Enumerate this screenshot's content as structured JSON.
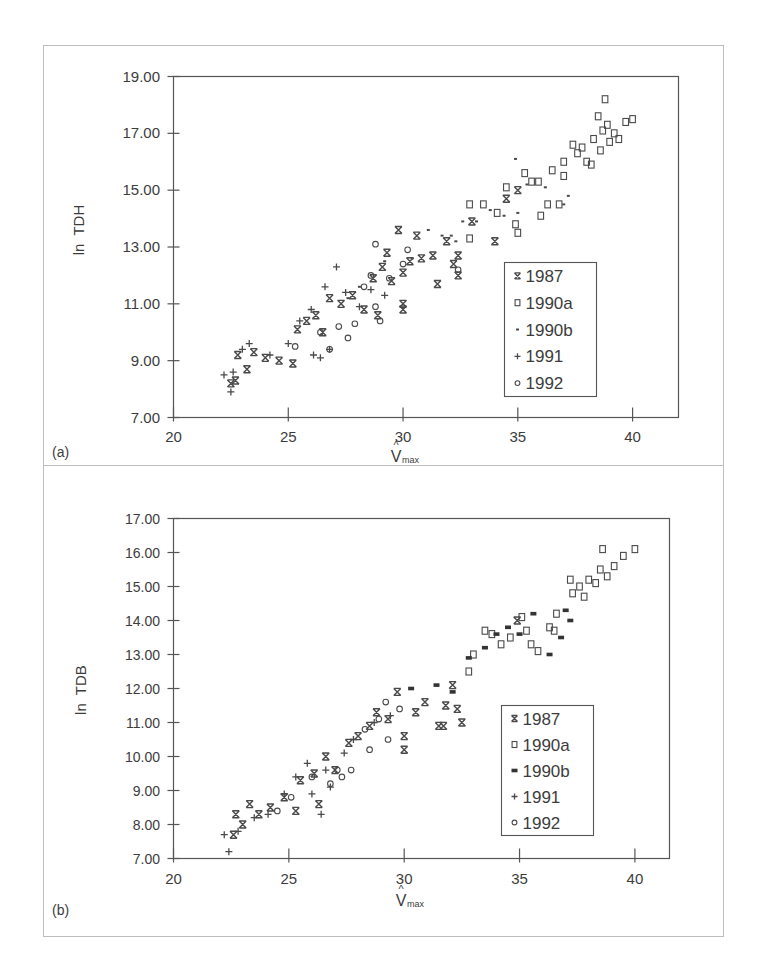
{
  "figure": {
    "panels": [
      "(a)",
      "(b)"
    ]
  },
  "chart_data": [
    {
      "type": "scatter",
      "panel_label": "(a)",
      "title": "",
      "xlabel": "V̂max",
      "xlabel_main": "V",
      "xlabel_hat": "^",
      "xlabel_sub": "max",
      "ylabel": "ln  TDH",
      "xlim": [
        20,
        42
      ],
      "ylim": [
        7,
        19
      ],
      "xticks": [
        20,
        25,
        30,
        35,
        40
      ],
      "xtick_labels": [
        "20",
        "25",
        "30",
        "35",
        "40"
      ],
      "yticks": [
        7,
        9,
        11,
        13,
        15,
        17,
        19
      ],
      "ytick_labels": [
        "7.00",
        "9.00",
        "11.00",
        "13.00",
        "15.00",
        "17.00",
        "19.00"
      ],
      "grid": false,
      "legend_position": "lower right (inside)",
      "legend": [
        "1987",
        "1990a",
        "1990b",
        "1991",
        "1992"
      ],
      "series": [
        {
          "name": "1987",
          "marker": "star-x",
          "points": [
            [
              22.5,
              8.2
            ],
            [
              22.7,
              8.3
            ],
            [
              22.8,
              9.2
            ],
            [
              23.2,
              8.7
            ],
            [
              23.5,
              9.3
            ],
            [
              24.0,
              9.1
            ],
            [
              24.6,
              9.0
            ],
            [
              25.2,
              8.9
            ],
            [
              25.4,
              10.1
            ],
            [
              25.8,
              10.4
            ],
            [
              26.2,
              10.6
            ],
            [
              26.5,
              10.0
            ],
            [
              26.8,
              11.2
            ],
            [
              27.3,
              11.0
            ],
            [
              27.8,
              11.3
            ],
            [
              28.3,
              10.8
            ],
            [
              28.7,
              11.9
            ],
            [
              28.9,
              10.6
            ],
            [
              29.1,
              12.3
            ],
            [
              29.3,
              12.8
            ],
            [
              29.5,
              11.8
            ],
            [
              29.8,
              13.6
            ],
            [
              30.0,
              12.1
            ],
            [
              30.0,
              11.0
            ],
            [
              30.0,
              10.8
            ],
            [
              30.3,
              12.5
            ],
            [
              30.6,
              13.4
            ],
            [
              30.8,
              12.6
            ],
            [
              31.5,
              11.7
            ],
            [
              31.3,
              12.7
            ],
            [
              31.9,
              13.2
            ],
            [
              32.2,
              12.4
            ],
            [
              32.4,
              12.0
            ],
            [
              32.4,
              12.7
            ],
            [
              33.0,
              13.9
            ],
            [
              34.0,
              13.2
            ],
            [
              34.5,
              14.7
            ],
            [
              35.0,
              15.0
            ]
          ]
        },
        {
          "name": "1990a",
          "marker": "open-square",
          "points": [
            [
              32.9,
              14.5
            ],
            [
              32.9,
              13.3
            ],
            [
              33.5,
              14.5
            ],
            [
              34.1,
              14.2
            ],
            [
              34.5,
              15.1
            ],
            [
              34.9,
              13.8
            ],
            [
              35.0,
              13.5
            ],
            [
              35.3,
              15.6
            ],
            [
              35.6,
              15.3
            ],
            [
              35.9,
              15.3
            ],
            [
              36.0,
              14.1
            ],
            [
              36.3,
              14.5
            ],
            [
              36.5,
              15.7
            ],
            [
              36.8,
              14.5
            ],
            [
              37.0,
              15.5
            ],
            [
              37.0,
              16.0
            ],
            [
              37.4,
              16.6
            ],
            [
              37.6,
              16.3
            ],
            [
              37.8,
              16.5
            ],
            [
              38.0,
              16.0
            ],
            [
              38.2,
              15.9
            ],
            [
              38.3,
              16.8
            ],
            [
              38.5,
              17.6
            ],
            [
              38.6,
              16.4
            ],
            [
              38.7,
              17.1
            ],
            [
              38.8,
              18.2
            ],
            [
              38.9,
              17.3
            ],
            [
              39.0,
              16.7
            ],
            [
              39.2,
              17.0
            ],
            [
              39.4,
              16.8
            ],
            [
              39.7,
              17.4
            ],
            [
              40.0,
              17.5
            ]
          ]
        },
        {
          "name": "1990b",
          "marker": "small-dot",
          "points": [
            [
              27.6,
              11.2
            ],
            [
              28.1,
              11.6
            ],
            [
              29.2,
              12.5
            ],
            [
              30.4,
              12.6
            ],
            [
              31.1,
              13.6
            ],
            [
              31.7,
              13.4
            ],
            [
              32.1,
              13.4
            ],
            [
              32.3,
              13.2
            ],
            [
              32.6,
              13.9
            ],
            [
              33.2,
              13.9
            ],
            [
              33.8,
              14.3
            ],
            [
              34.4,
              14.1
            ],
            [
              34.9,
              16.1
            ],
            [
              35.0,
              14.2
            ],
            [
              35.4,
              15.2
            ],
            [
              36.2,
              15.1
            ],
            [
              37.0,
              14.5
            ],
            [
              37.2,
              14.8
            ]
          ]
        },
        {
          "name": "1991",
          "marker": "plus",
          "points": [
            [
              22.2,
              8.5
            ],
            [
              22.5,
              7.9
            ],
            [
              22.6,
              8.6
            ],
            [
              23.0,
              9.4
            ],
            [
              23.3,
              9.6
            ],
            [
              24.2,
              9.2
            ],
            [
              25.0,
              9.6
            ],
            [
              25.5,
              10.4
            ],
            [
              26.0,
              10.8
            ],
            [
              26.1,
              9.2
            ],
            [
              26.4,
              9.1
            ],
            [
              26.6,
              11.6
            ],
            [
              26.8,
              9.4
            ],
            [
              27.1,
              12.3
            ],
            [
              27.5,
              11.4
            ],
            [
              28.1,
              10.9
            ],
            [
              28.6,
              11.5
            ],
            [
              29.2,
              11.3
            ]
          ]
        },
        {
          "name": "1992",
          "marker": "open-circle",
          "points": [
            [
              25.3,
              9.5
            ],
            [
              26.4,
              10.0
            ],
            [
              26.8,
              9.4
            ],
            [
              27.2,
              10.2
            ],
            [
              27.6,
              9.8
            ],
            [
              27.9,
              10.3
            ],
            [
              28.3,
              11.6
            ],
            [
              28.6,
              12.0
            ],
            [
              28.8,
              10.9
            ],
            [
              29.0,
              10.4
            ],
            [
              28.8,
              13.1
            ],
            [
              29.4,
              11.9
            ],
            [
              30.0,
              12.4
            ],
            [
              30.2,
              12.9
            ],
            [
              32.4,
              12.2
            ]
          ]
        }
      ]
    },
    {
      "type": "scatter",
      "panel_label": "(b)",
      "title": "",
      "xlabel": "V̂max",
      "xlabel_main": "V",
      "xlabel_hat": "^",
      "xlabel_sub": "max",
      "ylabel": "ln  TDB",
      "xlim": [
        20,
        41.5
      ],
      "ylim": [
        7,
        17
      ],
      "xticks": [
        20,
        25,
        30,
        35,
        40
      ],
      "xtick_labels": [
        "20",
        "25",
        "30",
        "35",
        "40"
      ],
      "yticks": [
        7,
        8,
        9,
        10,
        11,
        12,
        13,
        14,
        15,
        16,
        17
      ],
      "ytick_labels": [
        "7.00",
        "8.00",
        "9.00",
        "10.00",
        "11.00",
        "12.00",
        "13.00",
        "14.00",
        "15.00",
        "16.00",
        "17.00"
      ],
      "grid": false,
      "legend_position": "lower right (inside)",
      "legend": [
        "1987",
        "1990a",
        "1990b",
        "1991",
        "1992"
      ],
      "series": [
        {
          "name": "1987",
          "marker": "star-x",
          "points": [
            [
              22.6,
              7.7
            ],
            [
              22.7,
              8.3
            ],
            [
              23.0,
              8.0
            ],
            [
              23.3,
              8.6
            ],
            [
              23.7,
              8.3
            ],
            [
              24.2,
              8.5
            ],
            [
              24.8,
              8.8
            ],
            [
              25.3,
              8.4
            ],
            [
              25.5,
              9.3
            ],
            [
              26.1,
              9.5
            ],
            [
              26.3,
              8.6
            ],
            [
              26.6,
              10.0
            ],
            [
              27.0,
              9.6
            ],
            [
              27.6,
              10.4
            ],
            [
              28.0,
              10.6
            ],
            [
              28.5,
              10.9
            ],
            [
              28.8,
              11.3
            ],
            [
              29.3,
              11.1
            ],
            [
              29.7,
              11.9
            ],
            [
              30.0,
              10.6
            ],
            [
              30.0,
              10.2
            ],
            [
              30.5,
              11.3
            ],
            [
              30.9,
              11.6
            ],
            [
              31.5,
              10.9
            ],
            [
              31.7,
              10.9
            ],
            [
              31.8,
              11.5
            ],
            [
              32.1,
              12.1
            ],
            [
              32.3,
              11.4
            ],
            [
              32.5,
              11.0
            ],
            [
              34.9,
              14.0
            ]
          ]
        },
        {
          "name": "1990a",
          "marker": "open-square",
          "points": [
            [
              32.8,
              12.5
            ],
            [
              33.0,
              13.0
            ],
            [
              33.5,
              13.7
            ],
            [
              33.8,
              13.6
            ],
            [
              34.2,
              13.3
            ],
            [
              34.6,
              13.5
            ],
            [
              35.1,
              14.1
            ],
            [
              35.3,
              13.7
            ],
            [
              35.5,
              13.3
            ],
            [
              35.8,
              13.1
            ],
            [
              36.3,
              13.8
            ],
            [
              36.5,
              13.7
            ],
            [
              36.6,
              14.2
            ],
            [
              37.2,
              15.2
            ],
            [
              37.3,
              14.8
            ],
            [
              37.6,
              15.0
            ],
            [
              37.8,
              14.7
            ],
            [
              38.0,
              15.2
            ],
            [
              38.3,
              15.1
            ],
            [
              38.5,
              15.5
            ],
            [
              38.6,
              16.1
            ],
            [
              38.8,
              15.3
            ],
            [
              39.1,
              15.6
            ],
            [
              39.5,
              15.9
            ],
            [
              40.0,
              16.1
            ]
          ]
        },
        {
          "name": "1990b",
          "marker": "filled-dash",
          "points": [
            [
              30.3,
              12.0
            ],
            [
              31.4,
              12.1
            ],
            [
              32.1,
              11.9
            ],
            [
              32.8,
              12.9
            ],
            [
              33.5,
              13.2
            ],
            [
              34.0,
              13.6
            ],
            [
              34.5,
              13.8
            ],
            [
              35.0,
              13.6
            ],
            [
              35.6,
              14.2
            ],
            [
              36.3,
              13.0
            ],
            [
              36.8,
              13.5
            ],
            [
              37.0,
              14.3
            ],
            [
              37.2,
              14.0
            ]
          ]
        },
        {
          "name": "1991",
          "marker": "plus",
          "points": [
            [
              22.2,
              7.7
            ],
            [
              22.4,
              7.2
            ],
            [
              22.8,
              7.8
            ],
            [
              23.5,
              8.2
            ],
            [
              24.1,
              8.3
            ],
            [
              24.8,
              8.9
            ],
            [
              25.3,
              9.4
            ],
            [
              25.8,
              9.8
            ],
            [
              26.0,
              8.9
            ],
            [
              26.4,
              8.3
            ],
            [
              26.6,
              9.6
            ],
            [
              26.8,
              9.1
            ],
            [
              27.4,
              10.1
            ],
            [
              27.8,
              10.5
            ],
            [
              28.7,
              11.0
            ],
            [
              29.4,
              11.2
            ]
          ]
        },
        {
          "name": "1992",
          "marker": "open-circle",
          "points": [
            [
              24.5,
              8.4
            ],
            [
              25.1,
              8.8
            ],
            [
              26.0,
              9.4
            ],
            [
              26.8,
              9.2
            ],
            [
              27.1,
              9.6
            ],
            [
              27.3,
              9.4
            ],
            [
              27.7,
              9.6
            ],
            [
              28.3,
              10.8
            ],
            [
              28.5,
              10.2
            ],
            [
              28.9,
              11.1
            ],
            [
              29.2,
              11.6
            ],
            [
              29.3,
              10.5
            ],
            [
              29.8,
              11.4
            ]
          ]
        }
      ]
    }
  ]
}
